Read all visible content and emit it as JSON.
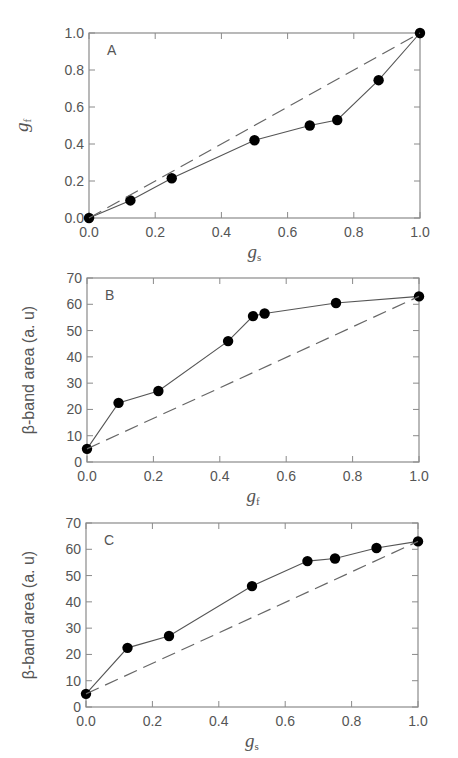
{
  "chart_data": [
    {
      "panel": "A",
      "type": "line",
      "panel_label": "A",
      "xlabel": "g",
      "xlabel_sub": "s",
      "ylabel": "g",
      "ylabel_sub": "f",
      "xlim": [
        0,
        1.0
      ],
      "ylim": [
        0,
        1.0
      ],
      "xticks": [
        0,
        0.2,
        0.4,
        0.6,
        0.8,
        1.0
      ],
      "xtick_labels": [
        "0.0",
        "0.2",
        "0.4",
        "0.6",
        "0.8",
        "1.0"
      ],
      "yticks": [
        0,
        0.2,
        0.4,
        0.6,
        0.8,
        1.0
      ],
      "ytick_labels": [
        "0.0",
        "0.2",
        "0.4",
        "0.6",
        "0.8",
        "1.0"
      ],
      "grid": false,
      "series": [
        {
          "name": "measured",
          "style": "solid-markers",
          "x": [
            0,
            0.125,
            0.25,
            0.5,
            0.667,
            0.75,
            0.875,
            1.0
          ],
          "y": [
            0,
            0.095,
            0.215,
            0.42,
            0.5,
            0.53,
            0.745,
            1.0
          ]
        },
        {
          "name": "linear reference",
          "style": "dashed",
          "x": [
            0,
            1.0
          ],
          "y": [
            0,
            1.0
          ]
        }
      ]
    },
    {
      "panel": "B",
      "type": "line",
      "panel_label": "B",
      "xlabel": "g",
      "xlabel_sub": "f",
      "ylabel": "β-band area (a. u)",
      "ylabel_sub": "",
      "xlim": [
        0,
        1.0
      ],
      "ylim": [
        0,
        70
      ],
      "xticks": [
        0,
        0.2,
        0.4,
        0.6,
        0.8,
        1.0
      ],
      "xtick_labels": [
        "0.0",
        "0.2",
        "0.4",
        "0.6",
        "0.8",
        "1.0"
      ],
      "yticks": [
        0,
        10,
        20,
        30,
        40,
        50,
        60,
        70
      ],
      "ytick_labels": [
        "0",
        "10",
        "20",
        "30",
        "40",
        "50",
        "60",
        "70"
      ],
      "grid": false,
      "series": [
        {
          "name": "measured",
          "style": "solid-markers",
          "x": [
            0,
            0.095,
            0.215,
            0.425,
            0.5,
            0.535,
            0.75,
            1.0
          ],
          "y": [
            5,
            22.5,
            27,
            46,
            55.5,
            56.5,
            60.5,
            63
          ]
        },
        {
          "name": "linear reference",
          "style": "dashed",
          "x": [
            0,
            1.0
          ],
          "y": [
            5,
            63
          ]
        }
      ]
    },
    {
      "panel": "C",
      "type": "line",
      "panel_label": "C",
      "xlabel": "g",
      "xlabel_sub": "s",
      "ylabel": "β-band area (a. u)",
      "ylabel_sub": "",
      "xlim": [
        0,
        1.0
      ],
      "ylim": [
        0,
        70
      ],
      "xticks": [
        0,
        0.2,
        0.4,
        0.6,
        0.8,
        1.0
      ],
      "xtick_labels": [
        "0.0",
        "0.2",
        "0.4",
        "0.6",
        "0.8",
        "1.0"
      ],
      "yticks": [
        0,
        10,
        20,
        30,
        40,
        50,
        60,
        70
      ],
      "ytick_labels": [
        "0",
        "10",
        "20",
        "30",
        "40",
        "50",
        "60",
        "70"
      ],
      "grid": false,
      "series": [
        {
          "name": "measured",
          "style": "solid-markers",
          "x": [
            0,
            0.125,
            0.25,
            0.5,
            0.667,
            0.75,
            0.875,
            1.0
          ],
          "y": [
            5,
            22.5,
            27,
            46,
            55.5,
            56.5,
            60.5,
            63
          ]
        },
        {
          "name": "linear reference",
          "style": "dashed",
          "x": [
            0,
            1.0
          ],
          "y": [
            5,
            63
          ]
        }
      ]
    }
  ],
  "colors": {
    "frame": "#8a8a8a",
    "line": "#555555",
    "marker": "#000000",
    "dashed": "#666666",
    "text": "#555555"
  }
}
